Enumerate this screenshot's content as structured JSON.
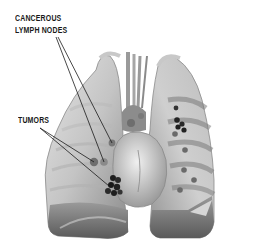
{
  "figure": {
    "labels": {
      "lymph_nodes_line1": "CANCEROUS",
      "lymph_nodes_line2": "LYMPH NODES",
      "tumors": "TUMORS"
    },
    "colors": {
      "background": "#ffffff",
      "label_text": "#1a1a1a",
      "lung_light": "#d8d8d8",
      "lung_mid": "#a8a8a8",
      "lung_dark": "#6e6e6e",
      "tumor": "#222222",
      "leader_line": "#1a1a1a"
    }
  }
}
